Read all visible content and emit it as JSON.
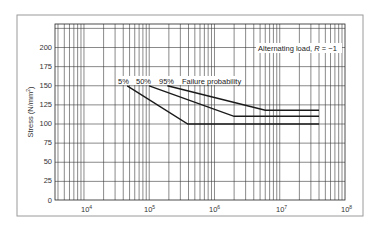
{
  "chart_data": {
    "type": "line",
    "title": "",
    "xlabel": "",
    "ylabel": "Stress (N/mm²)",
    "x_scale": "log",
    "xlim": [
      3600,
      100000000
    ],
    "ylim": [
      0,
      225
    ],
    "grid": true,
    "x_ticks": [
      10000,
      100000,
      1000000,
      10000000,
      100000000
    ],
    "x_tick_labels": [
      {
        "base": "10",
        "exp": "4"
      },
      {
        "base": "10",
        "exp": "5"
      },
      {
        "base": "10",
        "exp": "6"
      },
      {
        "base": "10",
        "exp": "7"
      },
      {
        "base": "10",
        "exp": "8"
      }
    ],
    "y_ticks": [
      0,
      25,
      50,
      75,
      100,
      125,
      150,
      175,
      200
    ],
    "y_tick_labels": [
      "0",
      "25",
      "50",
      "75",
      "100",
      "125",
      "150",
      "175",
      "200"
    ],
    "series": [
      {
        "name": "5%",
        "points": [
          [
            46000,
            150
          ],
          [
            390000,
            100
          ],
          [
            40000000,
            100
          ]
        ]
      },
      {
        "name": "50%",
        "points": [
          [
            100000,
            150
          ],
          [
            2000000,
            110
          ],
          [
            40000000,
            110
          ]
        ]
      },
      {
        "name": "95%",
        "points": [
          [
            190000,
            150
          ],
          [
            6000000,
            118
          ],
          [
            40000000,
            118
          ]
        ]
      }
    ],
    "annotations": [
      {
        "text_main": "Alternating load, ",
        "text_italic": "R",
        "text_tail": " = −1"
      },
      {
        "text": "Failure probability"
      }
    ],
    "legend_position": "inline labels above curve starts"
  },
  "labels": {
    "ylabel_main": "Stress (N/mm",
    "ylabel_sup": "2",
    "ylabel_close": ")",
    "series_5": "5%",
    "series_50": "50%",
    "series_95": "95%",
    "failure_probability": "Failure probability",
    "alternating_main": "Alternating load, ",
    "alternating_R": "R",
    "alternating_tail": " = −1",
    "x10": "10",
    "xexp4": "4",
    "xexp5": "5",
    "xexp6": "6",
    "xexp7": "7",
    "xexp8": "8",
    "y0": "0",
    "y25": "25",
    "y50": "50",
    "y75": "75",
    "y100": "100",
    "y125": "125",
    "y150": "150",
    "y175": "175",
    "y200": "200"
  }
}
